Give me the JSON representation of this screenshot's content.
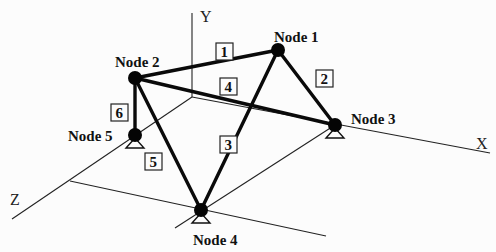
{
  "axes": {
    "x": {
      "label": "X",
      "from": [
        192,
        97
      ],
      "to": [
        490,
        153
      ],
      "label_pos": [
        476,
        149
      ]
    },
    "y": {
      "label": "Y",
      "from": [
        192,
        97
      ],
      "to": [
        192,
        13
      ],
      "label_pos": [
        200,
        22
      ]
    },
    "z": {
      "label": "Z",
      "from": [
        192,
        97
      ],
      "to": [
        12,
        219
      ],
      "label_pos": [
        10,
        205
      ]
    }
  },
  "ground_lines": [
    {
      "from": [
        70,
        181
      ],
      "to": [
        326,
        236
      ]
    },
    {
      "from": [
        175,
        228
      ],
      "to": [
        335,
        125
      ]
    }
  ],
  "nodes": [
    {
      "id": 1,
      "label": "Node 1",
      "x": 278,
      "y": 50,
      "support": false,
      "label_pos": [
        274,
        42
      ]
    },
    {
      "id": 2,
      "label": "Node 2",
      "x": 135,
      "y": 78,
      "support": false,
      "label_pos": [
        115,
        67
      ]
    },
    {
      "id": 3,
      "label": "Node 3",
      "x": 335,
      "y": 125,
      "support": true,
      "label_pos": [
        351,
        124
      ]
    },
    {
      "id": 4,
      "label": "Node 4",
      "x": 201,
      "y": 210,
      "support": true,
      "label_pos": [
        193,
        245
      ]
    },
    {
      "id": 5,
      "label": "Node 5",
      "x": 135,
      "y": 135,
      "support": true,
      "label_pos": [
        68,
        141
      ]
    }
  ],
  "members": [
    {
      "id": "1",
      "from": 2,
      "to": 1,
      "box": [
        216,
        43
      ]
    },
    {
      "id": "2",
      "from": 1,
      "to": 3,
      "box": [
        316,
        70
      ]
    },
    {
      "id": "3",
      "from": 1,
      "to": 4,
      "box": [
        220,
        136
      ]
    },
    {
      "id": "4",
      "from": 2,
      "to": 3,
      "box": [
        220,
        78
      ]
    },
    {
      "id": "5",
      "from": 2,
      "to": 4,
      "box": [
        145,
        153
      ]
    },
    {
      "id": "6",
      "from": 2,
      "to": 5,
      "box": [
        111,
        104
      ]
    }
  ]
}
